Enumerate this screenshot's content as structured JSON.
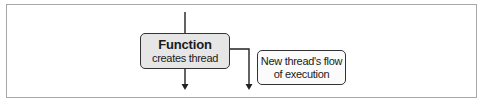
{
  "diagram": {
    "nodes": [
      {
        "id": "function",
        "title": "Function",
        "subtitle": "creates thread",
        "fill": "#e6e6e6"
      },
      {
        "id": "new-thread",
        "line1": "New thread's flow",
        "line2": "of execution",
        "fill": "#fbfbfb"
      }
    ],
    "edges": [
      {
        "from": "top",
        "to": "function",
        "style": "line"
      },
      {
        "from": "function",
        "to": "bottom-left",
        "style": "arrow-down"
      },
      {
        "from": "function",
        "to": "bottom-right",
        "style": "elbow-arrow-down"
      }
    ],
    "colors": {
      "stroke": "#222222",
      "frame": "#a8a8a8",
      "background": "#ffffff"
    }
  }
}
